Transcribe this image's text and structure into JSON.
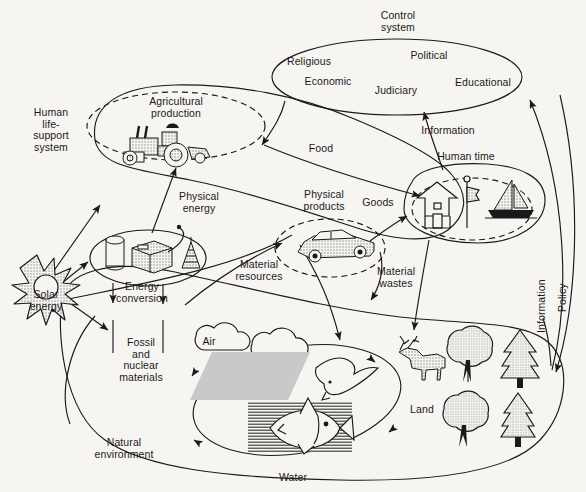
{
  "figure": {
    "background_color": "#f7f5f1",
    "line_color": "#1a1a1a",
    "fill_gray": "#c9c9c9"
  },
  "labels": {
    "control_system": "Control\nsystem",
    "religious": "Religious",
    "political": "Political",
    "economic": "Economic",
    "judiciary": "Judiciary",
    "educational": "Educational",
    "human_life_support": "Human\nlife-\nsupport\nsystem",
    "agricultural_production": "Agricultural\nproduction",
    "physical_energy": "Physical\nenergy",
    "physical_products": "Physical\nproducts",
    "human_time": "Human time",
    "goods": "Goods",
    "food": "Food",
    "information_top": "Information",
    "material_resources": "Material\nresources",
    "material_wastes": "Material\nwastes",
    "energy_conversion": "Energy\nconversion",
    "fossil_nuclear": "Fossil\nand\nnuclear\nmaterials",
    "solar_energy": "Solar\nenergy",
    "natural_environment": "Natural\nenvironment",
    "air": "Air",
    "water": "Water",
    "land": "Land",
    "information_side": "Information",
    "policy": "Policy"
  },
  "icons": {
    "tractor": "tractor-icon",
    "car": "car-icon",
    "house": "house-icon",
    "flag": "flag-icon",
    "sailboat": "sailboat-icon",
    "oil_tank": "oil-tank-icon",
    "generator": "generator-icon",
    "derrick": "oil-derrick-icon",
    "sun": "sun-icon",
    "cloud": "cloud-icon",
    "bird": "bird-icon",
    "fish": "fish-icon",
    "deer": "deer-icon",
    "deciduous_tree": "deciduous-tree-icon",
    "conifer_tree": "conifer-tree-icon"
  },
  "nodes": [
    {
      "id": "control-system",
      "label": "Control system",
      "shape": "ellipse"
    },
    {
      "id": "human-life-support-system",
      "label": "Human life-support system",
      "shape": "closed-curve"
    },
    {
      "id": "agricultural-production",
      "label": "Agricultural production",
      "shape": "dashed-ellipse"
    },
    {
      "id": "energy-conversion",
      "label": "Energy conversion",
      "shape": "ellipse"
    },
    {
      "id": "physical-products",
      "label": "Physical products",
      "shape": "dashed-ellipse"
    },
    {
      "id": "human-time",
      "label": "Human time",
      "shape": "dashed-ellipse"
    },
    {
      "id": "natural-environment",
      "label": "Natural environment",
      "shape": "closed-curve"
    },
    {
      "id": "air-water",
      "label": "Air / Water",
      "shape": "ellipse"
    }
  ],
  "flows": [
    {
      "from": "solar-energy",
      "to": "human-life-support-system",
      "label": ""
    },
    {
      "from": "solar-energy",
      "to": "energy-conversion",
      "label": ""
    },
    {
      "from": "solar-energy",
      "to": "natural-environment",
      "label": ""
    },
    {
      "from": "energy-conversion",
      "to": "agricultural-production",
      "label": "Physical energy"
    },
    {
      "from": "energy-conversion",
      "to": "fossil-and-nuclear-materials",
      "label": "Fossil and nuclear materials"
    },
    {
      "from": "agricultural-production",
      "to": "human-time",
      "label": "Food"
    },
    {
      "from": "physical-products",
      "to": "human-time",
      "label": "Goods"
    },
    {
      "from": "natural-environment",
      "to": "physical-products",
      "label": "Material resources"
    },
    {
      "from": "human-time",
      "to": "natural-environment",
      "label": "Material wastes"
    },
    {
      "from": "human-time",
      "to": "control-system",
      "label": "Information"
    },
    {
      "from": "natural-environment",
      "to": "control-system",
      "label": "Information"
    },
    {
      "from": "control-system",
      "to": "natural-environment",
      "label": "Policy"
    },
    {
      "from": "control-system",
      "to": "human-life-support-system",
      "label": ""
    }
  ]
}
